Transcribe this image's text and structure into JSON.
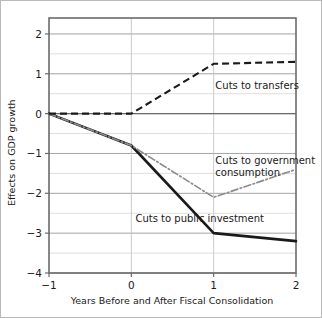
{
  "chart_data": {
    "type": "line",
    "title": "",
    "xlabel": "Years Before and After Fiscal Consolidation",
    "ylabel": "Effects on GDP growth",
    "x": [
      -1,
      0,
      1,
      2
    ],
    "xticks": [
      "-1",
      "0",
      "1",
      "2"
    ],
    "yticks": [
      "2",
      "1",
      "0",
      "-1",
      "-2",
      "-3",
      "-4"
    ],
    "xlim": [
      -1,
      2
    ],
    "ylim": [
      -4,
      2.4
    ],
    "grid": true,
    "minor_grid_step": 0.5,
    "legend_position": "inline-annotations",
    "series": [
      {
        "name": "Cuts to transfers",
        "style": "dashed",
        "color": "#1a1a1a",
        "values": [
          0,
          0,
          1.25,
          1.3
        ],
        "label_x": 1.02,
        "label_y": 0.62
      },
      {
        "name": "Cuts to government consumption",
        "style": "dash-dot",
        "color": "#8c8c8c",
        "values": [
          0,
          -0.8,
          -2.1,
          -1.4
        ],
        "label_x": 1.02,
        "label_y": -1.26,
        "label_line2": "consumption"
      },
      {
        "name": "Cuts to public investment",
        "style": "solid",
        "color": "#1a1a1a",
        "values": [
          0,
          -0.8,
          -3.0,
          -3.2
        ],
        "label_x": 0.05,
        "label_y": -2.72
      }
    ],
    "series_labels": {
      "transfers": "Cuts to transfers",
      "government_line1": "Cuts to government",
      "government_line2": "consumption",
      "investment": "Cuts to public investment"
    }
  }
}
